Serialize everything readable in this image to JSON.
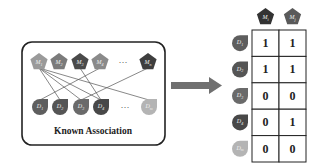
{
  "left_panel": {
    "caption": "Known Association",
    "mirnas": [
      {
        "id": "M1",
        "label": "M",
        "sub": "1",
        "color": "#9a9a9a",
        "x": 39
      },
      {
        "id": "M2",
        "label": "M",
        "sub": "2",
        "color": "#7b7b7b",
        "x": 59
      },
      {
        "id": "M3",
        "label": "M",
        "sub": "3",
        "color": "#4a4a4a",
        "x": 80
      },
      {
        "id": "M4",
        "label": "M",
        "sub": "4",
        "color": "#8a8a8a",
        "x": 100
      },
      {
        "id": "Mn",
        "label": "M",
        "sub": "n",
        "color": "#3e3e3e",
        "x": 148
      }
    ],
    "diseases": [
      {
        "id": "D1",
        "label": "D",
        "sub": "1",
        "color": "#5e5e5e",
        "x": 40
      },
      {
        "id": "D2",
        "label": "D",
        "sub": "2",
        "color": "#555555",
        "x": 60
      },
      {
        "id": "D3",
        "label": "D",
        "sub": "3",
        "color": "#6a6a6a",
        "x": 81
      },
      {
        "id": "D4",
        "label": "D",
        "sub": "4",
        "color": "#484848",
        "x": 101
      },
      {
        "id": "Dm",
        "label": "D",
        "sub": "m",
        "color": "#b4b4b4",
        "x": 149
      }
    ],
    "ellipsis": "···",
    "edges": [
      [
        "M1",
        "D2"
      ],
      [
        "M1",
        "D3"
      ],
      [
        "M1",
        "D4"
      ],
      [
        "M1",
        "Dm"
      ],
      [
        "M4",
        "D1"
      ],
      [
        "M3",
        "D4"
      ],
      [
        "Mn",
        "D3"
      ]
    ]
  },
  "arrow": {
    "direction": "right",
    "color": "#6e6e6e"
  },
  "matrix": {
    "columns": [
      {
        "label": "M",
        "sub": "i",
        "color": "#333333"
      },
      {
        "label": "M",
        "sub": "j",
        "color": "#5a5a5a"
      }
    ],
    "rows": [
      {
        "label": "D",
        "sub": "1",
        "color": "#5e5e5e",
        "values": [
          "1",
          "1"
        ]
      },
      {
        "label": "D",
        "sub": "2",
        "color": "#555555",
        "values": [
          "1",
          "1"
        ]
      },
      {
        "label": "D",
        "sub": "3",
        "color": "#6a6a6a",
        "values": [
          "0",
          "0"
        ]
      },
      {
        "label": "D",
        "sub": "4",
        "color": "#484848",
        "values": [
          "0",
          "1"
        ]
      },
      {
        "label": "D",
        "sub": "m",
        "color": "#b4b4b4",
        "values": [
          "0",
          "0"
        ]
      }
    ]
  }
}
